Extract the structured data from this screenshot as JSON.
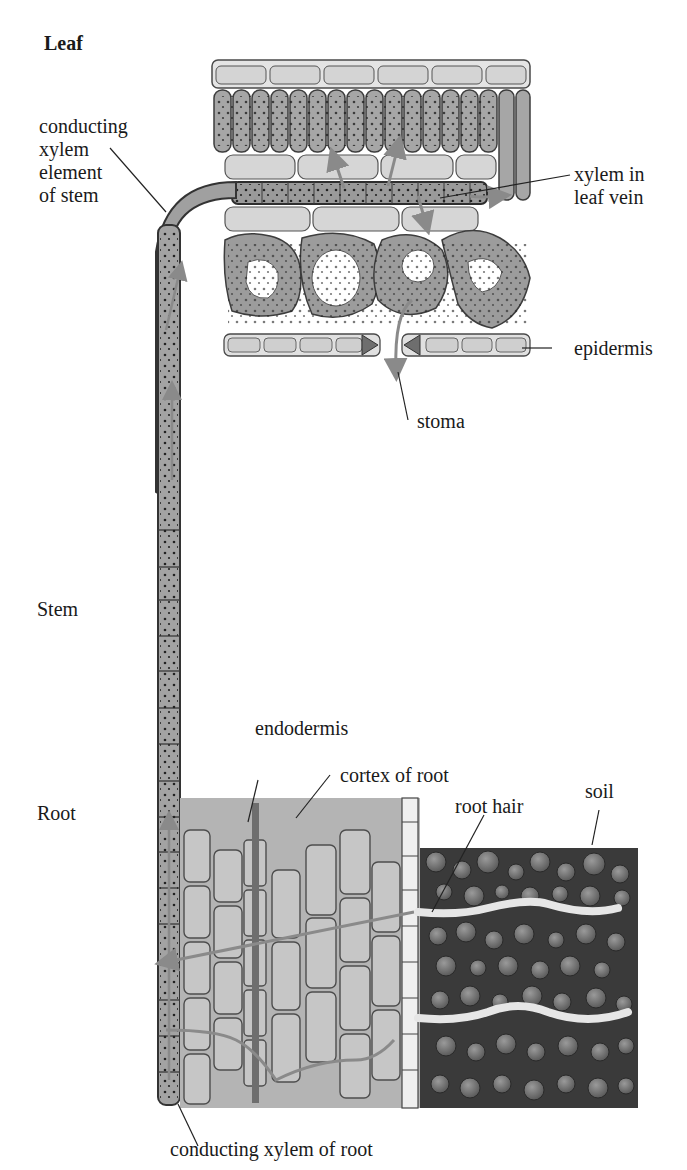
{
  "figure": {
    "sections": {
      "leaf": "Leaf",
      "stem": "Stem",
      "root": "Root"
    },
    "labels": {
      "conducting_xylem_stem": "conducting\nxylem\nelement\nof stem",
      "xylem_leaf_vein": "xylem in\nleaf vein",
      "epidermis": "epidermis",
      "stoma": "stoma",
      "endodermis": "endodermis",
      "cortex_of_root": "cortex of root",
      "root_hair": "root hair",
      "soil": "soil",
      "conducting_xylem_root": "conducting xylem of root"
    },
    "colors": {
      "cell_fill_light": "#d9d9d9",
      "cell_fill_mid": "#a9a9a9",
      "cell_fill_dark": "#8c8c8c",
      "cell_outline": "#4a4a4a",
      "soil_bg": "#3a3a3a",
      "soil_particle": "#7a7a7a",
      "arrow_color": "#8a8a8a",
      "text_color": "#1a1a1a"
    }
  }
}
